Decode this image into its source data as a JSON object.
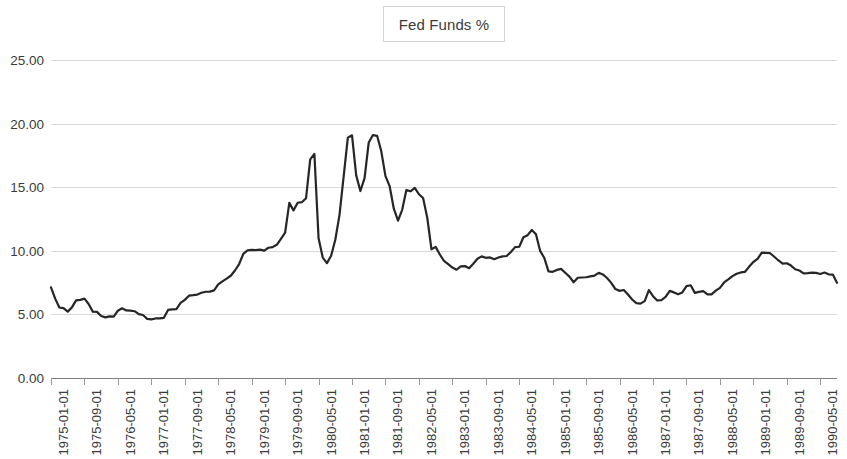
{
  "legend": {
    "label": "Fed Funds %",
    "position": "top-center",
    "border_color": "#d4d4d4"
  },
  "axis": {
    "y_ticks": [
      "0.00",
      "5.00",
      "10.00",
      "15.00",
      "20.00",
      "25.00"
    ],
    "x_ticks": [
      "1975-01-01",
      "1975-09-01",
      "1976-05-01",
      "1977-01-01",
      "1977-09-01",
      "1978-05-01",
      "1979-01-01",
      "1979-09-01",
      "1980-05-01",
      "1981-01-01",
      "1981-09-01",
      "1982-05-01",
      "1983-01-01",
      "1983-09-01",
      "1984-05-01",
      "1985-01-01",
      "1985-09-01",
      "1986-05-01",
      "1987-01-01",
      "1987-09-01",
      "1988-05-01",
      "1989-01-01",
      "1989-09-01",
      "1990-05-01"
    ]
  },
  "style": {
    "line_color": "#262626",
    "grid_color": "#d9d9d9",
    "axis_color": "#7f7f7f",
    "text_color": "#3b3b3b",
    "background": "#ffffff"
  },
  "chart_data": {
    "type": "line",
    "title": "",
    "xlabel": "",
    "ylabel": "",
    "ylim": [
      0,
      25
    ],
    "y_tick_step": 5,
    "grid": true,
    "legend_position": "top-center",
    "x_start": "1975-01-01",
    "x_end": "1990-09-01",
    "x_frequency": "monthly",
    "x_tick_interval_months": 8,
    "series": [
      {
        "name": "Fed Funds %",
        "color": "#262626",
        "x": [
          "1975-01",
          "1975-02",
          "1975-03",
          "1975-04",
          "1975-05",
          "1975-06",
          "1975-07",
          "1975-08",
          "1975-09",
          "1975-10",
          "1975-11",
          "1975-12",
          "1976-01",
          "1976-02",
          "1976-03",
          "1976-04",
          "1976-05",
          "1976-06",
          "1976-07",
          "1976-08",
          "1976-09",
          "1976-10",
          "1976-11",
          "1976-12",
          "1977-01",
          "1977-02",
          "1977-03",
          "1977-04",
          "1977-05",
          "1977-06",
          "1977-07",
          "1977-08",
          "1977-09",
          "1977-10",
          "1977-11",
          "1977-12",
          "1978-01",
          "1978-02",
          "1978-03",
          "1978-04",
          "1978-05",
          "1978-06",
          "1978-07",
          "1978-08",
          "1978-09",
          "1978-10",
          "1978-11",
          "1978-12",
          "1979-01",
          "1979-02",
          "1979-03",
          "1979-04",
          "1979-05",
          "1979-06",
          "1979-07",
          "1979-08",
          "1979-09",
          "1979-10",
          "1979-11",
          "1979-12",
          "1980-01",
          "1980-02",
          "1980-03",
          "1980-04",
          "1980-05",
          "1980-06",
          "1980-07",
          "1980-08",
          "1980-09",
          "1980-10",
          "1980-11",
          "1980-12",
          "1981-01",
          "1981-02",
          "1981-03",
          "1981-04",
          "1981-05",
          "1981-06",
          "1981-07",
          "1981-08",
          "1981-09",
          "1981-10",
          "1981-11",
          "1981-12",
          "1982-01",
          "1982-02",
          "1982-03",
          "1982-04",
          "1982-05",
          "1982-06",
          "1982-07",
          "1982-08",
          "1982-09",
          "1982-10",
          "1982-11",
          "1982-12",
          "1983-01",
          "1983-02",
          "1983-03",
          "1983-04",
          "1983-05",
          "1983-06",
          "1983-07",
          "1983-08",
          "1983-09",
          "1983-10",
          "1983-11",
          "1983-12",
          "1984-01",
          "1984-02",
          "1984-03",
          "1984-04",
          "1984-05",
          "1984-06",
          "1984-07",
          "1984-08",
          "1984-09",
          "1984-10",
          "1984-11",
          "1984-12",
          "1985-01",
          "1985-02",
          "1985-03",
          "1985-04",
          "1985-05",
          "1985-06",
          "1985-07",
          "1985-08",
          "1985-09",
          "1985-10",
          "1985-11",
          "1985-12",
          "1986-01",
          "1986-02",
          "1986-03",
          "1986-04",
          "1986-05",
          "1986-06",
          "1986-07",
          "1986-08",
          "1986-09",
          "1986-10",
          "1986-11",
          "1986-12",
          "1987-01",
          "1987-02",
          "1987-03",
          "1987-04",
          "1987-05",
          "1987-06",
          "1987-07",
          "1987-08",
          "1987-09",
          "1987-10",
          "1987-11",
          "1987-12",
          "1988-01",
          "1988-02",
          "1988-03",
          "1988-04",
          "1988-05",
          "1988-06",
          "1988-07",
          "1988-08",
          "1988-09",
          "1988-10",
          "1988-11",
          "1988-12",
          "1989-01",
          "1989-02",
          "1989-03",
          "1989-04",
          "1989-05",
          "1989-06",
          "1989-07",
          "1989-08",
          "1989-09",
          "1989-10",
          "1989-11",
          "1989-12",
          "1990-01",
          "1990-02",
          "1990-03",
          "1990-04",
          "1990-05",
          "1990-06",
          "1990-07",
          "1990-08",
          "1990-09"
        ],
        "values": [
          7.13,
          6.24,
          5.54,
          5.49,
          5.22,
          5.55,
          6.1,
          6.14,
          6.24,
          5.82,
          5.22,
          5.2,
          4.87,
          4.77,
          4.84,
          4.82,
          5.29,
          5.48,
          5.31,
          5.29,
          5.25,
          5.02,
          4.95,
          4.65,
          4.61,
          4.68,
          4.69,
          4.73,
          5.35,
          5.39,
          5.42,
          5.9,
          6.14,
          6.47,
          6.51,
          6.56,
          6.7,
          6.78,
          6.79,
          6.89,
          7.36,
          7.6,
          7.81,
          8.04,
          8.45,
          8.96,
          9.76,
          10.03,
          10.07,
          10.06,
          10.09,
          10.01,
          10.24,
          10.29,
          10.47,
          10.94,
          11.43,
          13.77,
          13.18,
          13.78,
          13.82,
          14.13,
          17.19,
          17.61,
          10.98,
          9.47,
          9.03,
          9.61,
          10.87,
          12.81,
          15.85,
          18.9,
          19.08,
          15.93,
          14.7,
          15.72,
          18.52,
          19.1,
          19.04,
          17.82,
          15.87,
          15.08,
          13.31,
          12.37,
          13.22,
          14.78,
          14.68,
          14.94,
          14.45,
          14.15,
          12.59,
          10.12,
          10.31,
          9.71,
          9.2,
          8.95,
          8.68,
          8.51,
          8.77,
          8.8,
          8.63,
          8.98,
          9.37,
          9.56,
          9.45,
          9.48,
          9.34,
          9.47,
          9.56,
          9.59,
          9.91,
          10.29,
          10.32,
          11.06,
          11.23,
          11.64,
          11.3,
          9.99,
          9.43,
          8.38,
          8.35,
          8.5,
          8.58,
          8.27,
          7.97,
          7.53,
          7.88,
          7.9,
          7.92,
          7.99,
          8.05,
          8.27,
          8.14,
          7.86,
          7.48,
          6.99,
          6.85,
          6.92,
          6.56,
          6.17,
          5.89,
          5.85,
          6.04,
          6.91,
          6.43,
          6.1,
          6.13,
          6.37,
          6.85,
          6.73,
          6.58,
          6.73,
          7.22,
          7.29,
          6.69,
          6.77,
          6.83,
          6.58,
          6.58,
          6.87,
          7.09,
          7.51,
          7.75,
          8.01,
          8.19,
          8.3,
          8.35,
          8.76,
          9.12,
          9.36,
          9.85,
          9.84,
          9.81,
          9.53,
          9.24,
          8.99,
          9.02,
          8.84,
          8.55,
          8.45,
          8.23,
          8.24,
          8.28,
          8.26,
          8.18,
          8.29,
          8.15,
          8.13,
          7.49
        ]
      }
    ]
  }
}
